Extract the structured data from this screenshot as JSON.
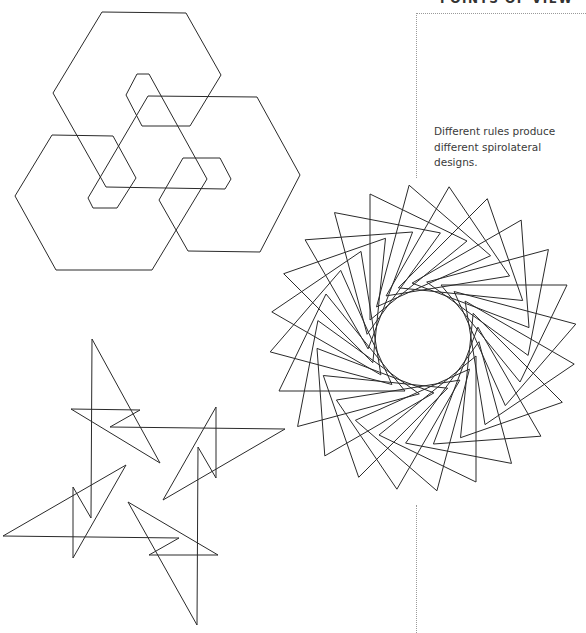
{
  "section": {
    "heading": "POINTS OF VIEW",
    "caption": "Different rules produce different spirolateral designs."
  },
  "colors": {
    "stroke": "#2a2a2a",
    "frame": "#9a9a9a",
    "background": "#ffffff"
  },
  "figures": {
    "hexagon_spirolateral": {
      "label": "hexagonal spirolateral",
      "points": [
        [
          102,
          12
        ],
        [
          186,
          13
        ],
        [
          221,
          75
        ],
        [
          190,
          126
        ],
        [
          142,
          126
        ],
        [
          126,
          95
        ],
        [
          137,
          74
        ],
        [
          149,
          74
        ],
        [
          207,
          179
        ],
        [
          152,
          270
        ],
        [
          56,
          270
        ],
        [
          15,
          196
        ],
        [
          52,
          135
        ],
        [
          113,
          136
        ],
        [
          136,
          178
        ],
        [
          117,
          208
        ],
        [
          93,
          208
        ],
        [
          88,
          198
        ],
        [
          148,
          96
        ],
        [
          257,
          97
        ],
        [
          300,
          175
        ],
        [
          260,
          252
        ],
        [
          188,
          251
        ],
        [
          159,
          200
        ],
        [
          183,
          158
        ],
        [
          220,
          158
        ],
        [
          231,
          179
        ],
        [
          225,
          189
        ],
        [
          106,
          187
        ],
        [
          53,
          93
        ]
      ]
    },
    "star_spirolateral": {
      "label": "pinwheel spirolateral",
      "points": [
        [
          92,
          339
        ],
        [
          91,
          518
        ],
        [
          73,
          487
        ],
        [
          73,
          558
        ],
        [
          126,
          465
        ],
        [
          3,
          536
        ],
        [
          179,
          538
        ],
        [
          149,
          555
        ],
        [
          218,
          555
        ],
        [
          128,
          502
        ],
        [
          197,
          625
        ],
        [
          198,
          447
        ],
        [
          216,
          478
        ],
        [
          216,
          407
        ],
        [
          163,
          500
        ],
        [
          285,
          429
        ],
        [
          110,
          427
        ],
        [
          140,
          410
        ],
        [
          71,
          409
        ],
        [
          160,
          463
        ]
      ]
    },
    "rosette_spirolateral": {
      "label": "triangular rosette spirolateral",
      "center": [
        423,
        338
      ],
      "count": 24,
      "step_degrees": 15,
      "base_triangle": [
        [
          -53,
          -144
        ],
        [
          44,
          -97
        ],
        [
          -53,
          -18
        ]
      ]
    }
  }
}
